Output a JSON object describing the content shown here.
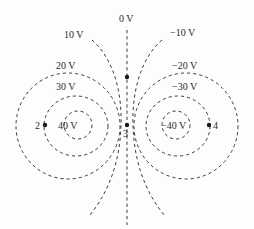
{
  "diagram": {
    "type": "equipotential-lines",
    "line_style": "dashed",
    "labels": {
      "v0": "0 V",
      "v10": "10 V",
      "vm10": "−10 V",
      "v20": "20 V",
      "vm20": "−20 V",
      "v30": "30 V",
      "vm30": "−30 V",
      "v40": "40 V",
      "vm40": "−40 V"
    },
    "points": {
      "p1": "1",
      "p2": "2",
      "p3": "3",
      "p4": "4"
    },
    "colors": {
      "line": "#3a3a3a",
      "text": "#2a2a2a",
      "background": "#fdfdfd"
    }
  }
}
